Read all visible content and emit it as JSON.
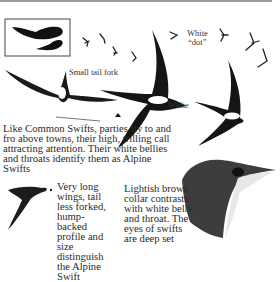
{
  "labels": {
    "small_tail_fork": "Small tail fork",
    "white_dot_line1": "White",
    "white_dot_line2": "“dot”",
    "white": "White"
  },
  "captions": {
    "parties": "Like Common Swifts, parties fly to and fro above towns, their high, trilling call attracting attention. Their white bellies and throats identify them as Alpine Swifts",
    "wings": "Very long wings, tail less forked, hump-backed profile and size distinguish the Alpine Swift",
    "collar": "Lightish brown collar contrasts with white belly and throat. The eyes of swifts are deep set"
  },
  "icons": [
    "size-comparison-silhouettes",
    "distant-swift-flock",
    "swift-underside-illustration",
    "swift-side-profile",
    "swift-head-portrait",
    "pointer-arrow"
  ]
}
